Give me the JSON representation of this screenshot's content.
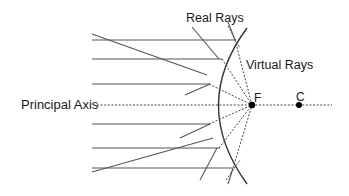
{
  "diagram": {
    "labels": {
      "real_rays": "Real Rays",
      "virtual_rays": "Virtual Rays",
      "principal_axis": "Principal Axis",
      "focus": "F",
      "center": "C"
    },
    "colors": {
      "line": "#333333",
      "ray": "#555555",
      "dashed": "#444444",
      "point": "#000000",
      "text": "#1a1a1a"
    },
    "points": {
      "focus": {
        "x": 252,
        "y": 105
      },
      "center": {
        "x": 299,
        "y": 105
      }
    },
    "incident_rays_y": [
      40,
      59,
      84,
      124,
      148,
      168
    ],
    "oblique_rays": [
      {
        "from": [
          92,
          34
        ],
        "to": [
          207,
          75
        ]
      },
      {
        "from": [
          92,
          172
        ],
        "to": [
          213,
          138
        ]
      }
    ]
  }
}
